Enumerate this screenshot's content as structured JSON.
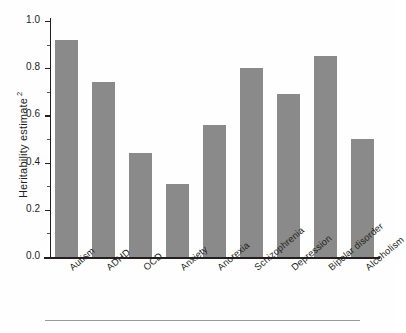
{
  "chart_data": {
    "type": "bar",
    "title": "",
    "xlabel": "",
    "ylabel": "Heritability estimate",
    "ylabel_superscript": "2",
    "ylim": [
      0.0,
      1.0
    ],
    "grid": false,
    "legend": null,
    "bar_color": "#8a8a8a",
    "axis_color": "#231f20",
    "background_color": "#fefefe",
    "categories": [
      "Autism",
      "ADHD",
      "OCD",
      "Anxiety",
      "Anorexia",
      "Schizophrenia",
      "Depression",
      "Bipolar disorder",
      "Alcoholism"
    ],
    "values": [
      0.92,
      0.74,
      0.44,
      0.31,
      0.56,
      0.8,
      0.69,
      0.85,
      0.5
    ],
    "ytick_labels": [
      "0.0",
      "0.2",
      "0.4",
      "0.6",
      "0.8",
      "1.0"
    ],
    "ytick_values": [
      0.0,
      0.2,
      0.4,
      0.6,
      0.8,
      1.0
    ],
    "yminor_values": [
      0.1,
      0.3,
      0.5,
      0.7,
      0.9
    ]
  }
}
